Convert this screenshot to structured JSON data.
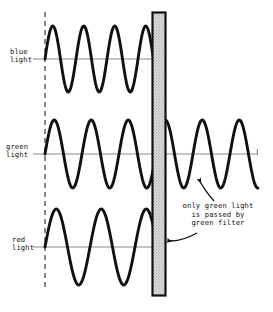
{
  "figure": {
    "background_color": "#ffffff",
    "ink_color": "#111111",
    "axis_color": "#808080",
    "filter_fill": "#d8d8d8",
    "width": 273,
    "height": 312
  },
  "labels": {
    "blue": "blue\nlight",
    "green": "green\nlight",
    "red": "red\nlight"
  },
  "annotation": {
    "text": "only green light\nis passed by\ngreen filter"
  },
  "chart_data": {
    "type": "line",
    "xlabel": "",
    "ylabel": "",
    "grid": false,
    "legend": "left-labels",
    "xlim": [
      45,
      258
    ],
    "annotations": [
      {
        "text": "only green light is passed by green filter",
        "x": 218,
        "y": 215,
        "arrows": [
          {
            "from": [
              196,
              232
            ],
            "to": [
              164,
              240
            ],
            "target": "green-filter-bar"
          },
          {
            "from": [
              212,
              200
            ],
            "to": [
              198,
              176
            ],
            "target": "transmitted-green-wave"
          }
        ]
      }
    ],
    "filter": {
      "name": "green filter",
      "x_left": 152,
      "x_right": 165,
      "y_top": 12,
      "y_bottom": 295,
      "fill": "#d8d8d8"
    },
    "source_line": {
      "x": 45,
      "y_top": 12,
      "y_bottom": 290,
      "style": "dashed"
    },
    "series": [
      {
        "name": "blue light",
        "color": "#111111",
        "baseline_y": 59,
        "amplitude": 33,
        "wavelength": 31,
        "cycles_before_filter": 3.5,
        "cycles_after_filter": 0,
        "x_start": 45,
        "x_stop": 155,
        "blocked_by_filter": true
      },
      {
        "name": "green light",
        "color": "#111111",
        "baseline_y": 154,
        "amplitude": 34,
        "wavelength": 37,
        "cycles_before_filter": 3,
        "cycles_after_filter": 2.5,
        "x_start": 45,
        "x_stop": 258,
        "blocked_by_filter": false
      },
      {
        "name": "red light",
        "color": "#111111",
        "baseline_y": 247,
        "amplitude": 38,
        "wavelength": 45,
        "cycles_before_filter": 2.5,
        "cycles_after_filter": 0,
        "x_start": 45,
        "x_stop": 155,
        "blocked_by_filter": true
      }
    ]
  }
}
